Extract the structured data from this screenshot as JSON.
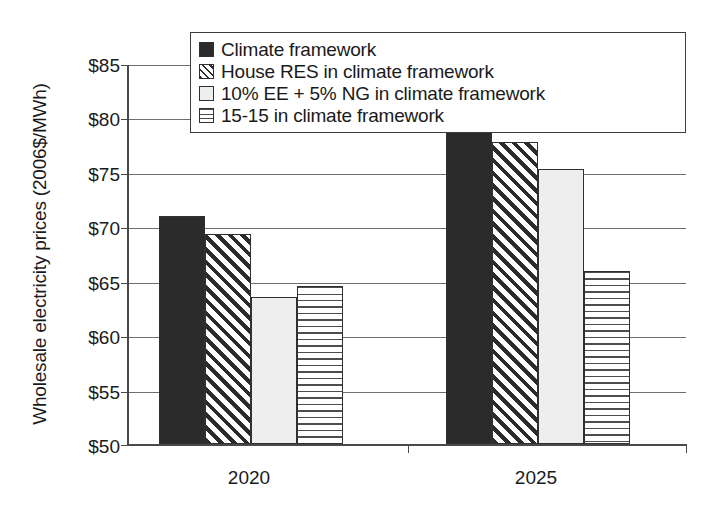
{
  "chart_data": {
    "type": "bar",
    "title": "",
    "xlabel": "",
    "ylabel": "Wholesale electricity prices (2006$/MWh)",
    "categories": [
      "2020",
      "2025"
    ],
    "ylim": [
      50,
      85
    ],
    "ytick_values": [
      50,
      55,
      60,
      65,
      70,
      75,
      80,
      85
    ],
    "ytick_labels": [
      "$50",
      "$55",
      "$60",
      "$65",
      "$70",
      "$75",
      "$80",
      "$85"
    ],
    "grid": true,
    "legend_position": "top-right-inside",
    "series": [
      {
        "name": "Climate framework",
        "pattern": "solid-dark",
        "color": "#2b2b2b",
        "values": [
          71.1,
          79.2
        ]
      },
      {
        "name": "House RES in climate framework",
        "pattern": "diagonal-hatch",
        "color": "#2b2b2b",
        "values": [
          69.4,
          77.9
        ]
      },
      {
        "name": "10% EE + 5% NG in climate framework",
        "pattern": "light-solid",
        "color": "#eeeeee",
        "values": [
          63.6,
          75.4
        ]
      },
      {
        "name": "15-15 in climate framework",
        "pattern": "horizontal-hatch",
        "color": "#4d4d4d",
        "values": [
          64.6,
          66.0
        ]
      }
    ]
  },
  "axes": {
    "y_title": "Wholesale electricity prices (2006$/MWh)",
    "y_ticks": [
      {
        "label": "$85"
      },
      {
        "label": "$80"
      },
      {
        "label": "$75"
      },
      {
        "label": "$70"
      },
      {
        "label": "$65"
      },
      {
        "label": "$60"
      },
      {
        "label": "$55"
      },
      {
        "label": "$50"
      }
    ],
    "x_ticks": [
      {
        "label": "2020"
      },
      {
        "label": "2025"
      }
    ]
  },
  "legend": {
    "items": [
      {
        "label": "Climate framework"
      },
      {
        "label": "House RES in climate framework"
      },
      {
        "label": "10% EE + 5% NG in climate framework"
      },
      {
        "label": "15-15 in climate framework"
      }
    ]
  }
}
